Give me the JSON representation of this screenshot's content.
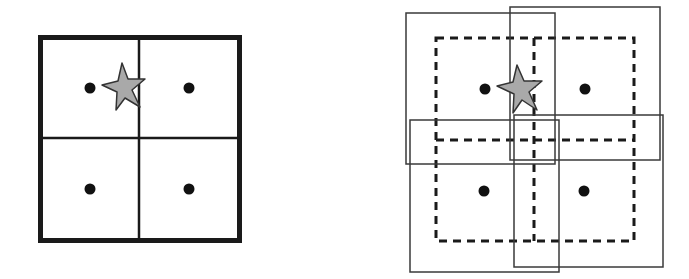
{
  "colors": {
    "background": "#ffffff",
    "stroke": "#1a1a1a",
    "solid_window_stroke": "#3a3a3a",
    "star_fill": "#a9a9a9",
    "dot": "#111111"
  },
  "left_panel": {
    "description": "2x2 grid with thick outer border, one dot per cell, star near shared edge",
    "outer_border": {
      "x": 38,
      "y": 35,
      "w": 204,
      "h": 208,
      "stroke_width": 5
    },
    "divider_vertical_x": 139,
    "divider_horizontal_y": 138,
    "dots": [
      {
        "cx": 90,
        "cy": 88
      },
      {
        "cx": 189,
        "cy": 88
      },
      {
        "cx": 90,
        "cy": 189
      },
      {
        "cx": 189,
        "cy": 189
      }
    ],
    "star": {
      "points": "122,63 128,79 145,79 132,90 140,107 125,98 116,110 117,92 102,85 118,81"
    }
  },
  "right_panel": {
    "description": "2x2 dashed grid overlaid with four overlapping solid rectangles (jittered/expanded windows), one dot per cell, star near shared edge",
    "dashed_grid": {
      "x": 436,
      "y": 38,
      "w": 198,
      "h": 203,
      "mid_x": 534,
      "mid_y": 140
    },
    "solid_windows": [
      {
        "name": "top-left-window",
        "x": 406,
        "y": 13,
        "w": 149,
        "h": 151
      },
      {
        "name": "top-right-window",
        "x": 510,
        "y": 7,
        "w": 150,
        "h": 153
      },
      {
        "name": "bottom-left-window",
        "x": 410,
        "y": 120,
        "w": 149,
        "h": 152
      },
      {
        "name": "bottom-right-window",
        "x": 514,
        "y": 115,
        "w": 149,
        "h": 152
      }
    ],
    "dots": [
      {
        "cx": 485,
        "cy": 89
      },
      {
        "cx": 585,
        "cy": 89
      },
      {
        "cx": 484,
        "cy": 191
      },
      {
        "cx": 584,
        "cy": 191
      }
    ],
    "star": {
      "points": "517,65 524,81 542,81 529,92 537,110 522,100 513,113 514,94 497,86 513,82"
    }
  }
}
